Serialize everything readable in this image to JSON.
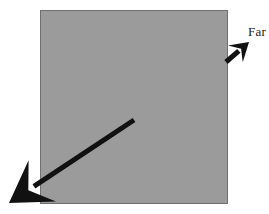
{
  "figure": {
    "background_color": "#ffffff",
    "width": 269,
    "height": 214
  },
  "surface": {
    "name": "gray-square-region",
    "fill_color": "#9b9b9b",
    "border_color": "#6f6f6f",
    "x": 40,
    "y": 10,
    "width": 188,
    "height": 194
  },
  "labels": {
    "far": "Far"
  },
  "arrows": [
    {
      "id": "long-arrow",
      "label": "",
      "color": "#111111",
      "stroke_width": 5,
      "tail_x": 134,
      "tail_y": 120,
      "tip_x": 9,
      "tip_y": 203,
      "direction": "down-left"
    },
    {
      "id": "far-arrow",
      "label": "Far",
      "color": "#111111",
      "stroke_width": 5,
      "tail_x": 226,
      "tail_y": 62,
      "tip_x": 249,
      "tip_y": 42,
      "direction": "up-right"
    }
  ]
}
